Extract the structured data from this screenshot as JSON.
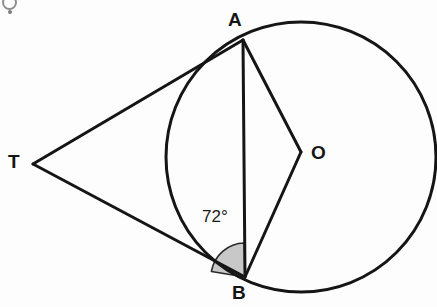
{
  "figure": {
    "kind": "circle-tangent-geometry-diagram",
    "width": 437,
    "height": 307,
    "background_color": "#fdfdfd",
    "stroke_color": "#151515",
    "shade_color": "#c8c8c8"
  },
  "labels": {
    "point_a": "A",
    "point_b": "B",
    "point_t": "T",
    "point_o": "O",
    "angle_value": "72°"
  },
  "geometry": {
    "circle": {
      "cx": 301,
      "cy": 157,
      "r": 135
    },
    "points": {
      "A": {
        "x": 243,
        "y": 40
      },
      "B": {
        "x": 245,
        "y": 277
      },
      "T": {
        "x": 33,
        "y": 164
      },
      "O": {
        "x": 301,
        "y": 152
      }
    },
    "segments": [
      {
        "name": "tangent-TA",
        "from": "T",
        "to": "A"
      },
      {
        "name": "tangent-TB",
        "from": "T",
        "to": "B"
      },
      {
        "name": "chord-AB",
        "from": "A",
        "to": "B"
      },
      {
        "name": "radius-OA",
        "from": "O",
        "to": "A"
      },
      {
        "name": "radius-OB",
        "from": "O",
        "to": "B"
      }
    ],
    "shaded_angle": {
      "at": "B",
      "between": [
        "tangent-TB",
        "chord-BA"
      ],
      "measure_degrees": 72,
      "radius": 34
    }
  }
}
